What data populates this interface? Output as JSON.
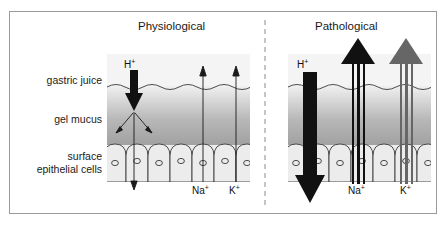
{
  "figure": {
    "kind": "scientific-diagram",
    "border_color": "#9a9a9a",
    "background": "#ffffff"
  },
  "panels": [
    {
      "id": "physiological",
      "title": "Physiological"
    },
    {
      "id": "pathological",
      "title": "Pathological"
    }
  ],
  "divider": {
    "style": "dashed",
    "color": "#8a8a8a"
  },
  "layer_labels": {
    "gastric_juice": "gastric juice",
    "gel_mucus": "gel mucus",
    "surface_line1": "surface",
    "surface_line2": "epithelial cells"
  },
  "ions": {
    "hydrogen": "H",
    "hydrogen_charge": "+",
    "sodium": "Na",
    "sodium_charge": "+",
    "potassium": "K",
    "potassium_charge": "+"
  },
  "annotations": {
    "physiological": {
      "h_label": "H",
      "h_charge": "+",
      "na_label": "Na",
      "na_charge": "+",
      "k_label": "K",
      "k_charge": "+"
    },
    "pathological": {
      "h_label": "H",
      "h_charge": "+",
      "na_label": "Na",
      "na_charge": "+",
      "k_label": "K",
      "k_charge": "+"
    }
  },
  "colors": {
    "arrow_black": "#111111",
    "arrow_gray": "#666666",
    "mucus_top": "#f2f2f2",
    "mucus_bottom": "#9f9f9f",
    "juice_fill": "#f4f4f4",
    "cell_fill": "#e8e8e8",
    "outline": "#3a3a3a",
    "text": "#1a1a1a"
  }
}
